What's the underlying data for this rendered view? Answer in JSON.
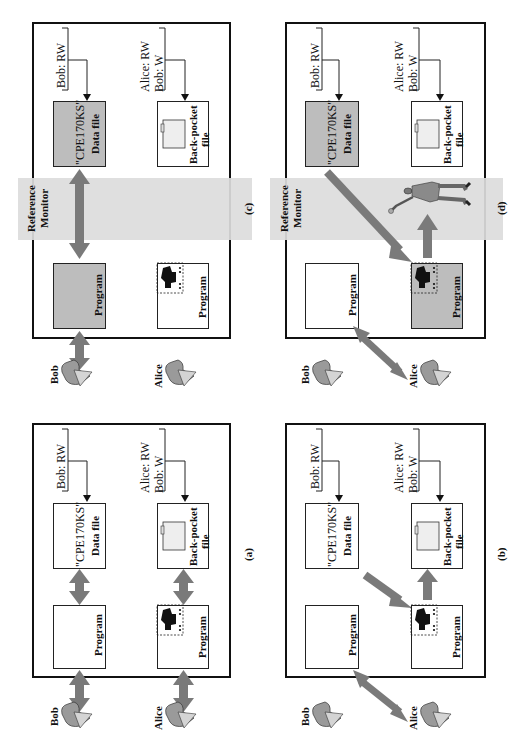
{
  "figure": {
    "orientation": "rotated-90-ccw",
    "colors": {
      "arrow": "#7a7a7a",
      "shaded_box": "#bdbdbd",
      "monitor_band": "#dcdcdc",
      "outline": "#111111"
    },
    "panels": [
      {
        "id": "c",
        "caption": "(c)",
        "reference_monitor": "Reference",
        "reference_monitor_line2": "Monitor",
        "users": {
          "bob": "Bob",
          "alice": "Alice"
        },
        "bob_program": "Program",
        "alice_program": "Program",
        "data_file_name": "\"CPE170KS\"",
        "data_file_label": "Data file",
        "back_pocket_label": "Back-pocket",
        "back_pocket_label2": "file",
        "acl_data": "Bob: RW",
        "acl_back_line1": "Alice: RW",
        "acl_back_line2": "Bob: W"
      },
      {
        "id": "d",
        "caption": "(d)",
        "reference_monitor": "Reference",
        "reference_monitor_line2": "Monitor",
        "users": {
          "bob": "Bob",
          "alice": "Alice"
        },
        "bob_program": "Program",
        "alice_program": "Program",
        "data_file_name": "\"CPE170KS\"",
        "data_file_label": "Data file",
        "back_pocket_label": "Back-pocket",
        "back_pocket_label2": "file",
        "acl_data": "Bob: RW",
        "acl_back_line1": "Alice: RW",
        "acl_back_line2": "Bob: W"
      },
      {
        "id": "a",
        "caption": "(a)",
        "users": {
          "bob": "Bob",
          "alice": "Alice"
        },
        "bob_program": "Program",
        "alice_program": "Program",
        "data_file_name": "\"CPE170KS\"",
        "data_file_label": "Data file",
        "back_pocket_label": "Back-pocket",
        "back_pocket_label2": "file",
        "acl_data": "Bob: RW",
        "acl_back_line1": "Alice: RW",
        "acl_back_line2": "Bob: W"
      },
      {
        "id": "b",
        "caption": "(b)",
        "users": {
          "bob": "Bob",
          "alice": "Alice"
        },
        "bob_program": "Program",
        "alice_program": "Program",
        "data_file_name": "\"CPE170KS\"",
        "data_file_label": "Data file",
        "back_pocket_label": "Back-pocket",
        "back_pocket_label2": "file",
        "acl_data": "Bob: RW",
        "acl_back_line1": "Alice: RW",
        "acl_back_line2": "Bob: W"
      }
    ]
  }
}
